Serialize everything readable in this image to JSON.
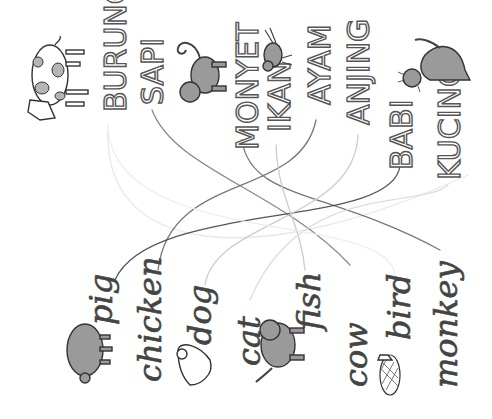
{
  "worksheet": {
    "type": "matching-exercise",
    "orientation": "rotated-90",
    "indonesian_words": [
      {
        "label": "BURUNG",
        "x": 112,
        "y": 105
      },
      {
        "label": "SAPI",
        "x": 150,
        "y": 103
      },
      {
        "label": "MONYET",
        "x": 247,
        "y": 150
      },
      {
        "label": "IKAN",
        "x": 280,
        "y": 130
      },
      {
        "label": "AYAM",
        "x": 318,
        "y": 103
      },
      {
        "label": "ANJING",
        "x": 358,
        "y": 122
      },
      {
        "label": "BABI",
        "x": 400,
        "y": 175
      },
      {
        "label": "KUCING",
        "x": 447,
        "y": 180
      }
    ],
    "english_words": [
      {
        "label": "pig",
        "x": 100,
        "y": 325
      },
      {
        "label": "chicken",
        "x": 148,
        "y": 365
      },
      {
        "label": "dog",
        "x": 200,
        "y": 345
      },
      {
        "label": "cat",
        "x": 248,
        "y": 360
      },
      {
        "label": "fish",
        "x": 310,
        "y": 315
      },
      {
        "label": "cow",
        "x": 355,
        "y": 387
      },
      {
        "label": "bird",
        "x": 400,
        "y": 335
      },
      {
        "label": "monkey",
        "x": 445,
        "y": 385
      }
    ],
    "pictures": [
      {
        "name": "cow",
        "near": "BURUNG"
      },
      {
        "name": "monkey",
        "near": "SAPI"
      },
      {
        "name": "bird",
        "near": "IKAN"
      },
      {
        "name": "cat",
        "near": "KUCING"
      },
      {
        "name": "pig",
        "near": "pig"
      },
      {
        "name": "chicken",
        "near": "dog"
      },
      {
        "name": "dog",
        "near": "cat"
      },
      {
        "name": "fish",
        "near": "bird"
      }
    ],
    "colors": {
      "background": "#ffffff",
      "line_dark": "#555555",
      "line_mid": "#888888",
      "line_light": "#cfcfcf",
      "line_faint": "#e6e6e6",
      "animal_fill": "#9a9a9a"
    }
  }
}
